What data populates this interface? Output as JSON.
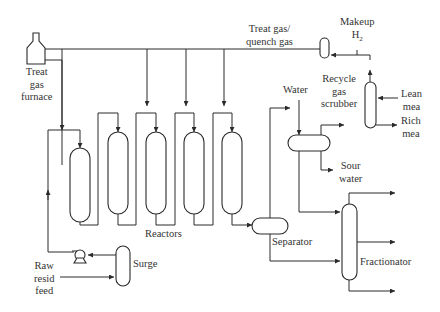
{
  "diagram": {
    "colors": {
      "line": "#2a2a2a",
      "text": "#333333",
      "background": "#ffffff"
    },
    "labels": {
      "furnace": [
        "Treat",
        "gas",
        "furnace"
      ],
      "treat_gas": [
        "Treat gas/",
        "quench gas"
      ],
      "makeup": "Makeup",
      "h2": "H",
      "h2_sub": "2",
      "recycle": [
        "Recycle",
        "gas",
        "scrubber"
      ],
      "lean": [
        "Lean",
        "mea"
      ],
      "rich": [
        "Rich",
        "mea"
      ],
      "water": "Water",
      "sour": [
        "Sour",
        "water"
      ],
      "reactors": "Reactors",
      "separator": "Separator",
      "fractionator": "Fractionator",
      "surge": "Surge",
      "raw_feed": [
        "Raw",
        "resid",
        "feed"
      ]
    },
    "nodes": [
      "Treat gas furnace",
      "Reactor 1",
      "Reactor 2",
      "Reactor 3",
      "Reactor 4",
      "Reactor 5",
      "Separator",
      "Water wash drum",
      "Recycle gas knockout",
      "Recycle gas scrubber",
      "Fractionator",
      "Surge drum",
      "Feed pump"
    ]
  }
}
